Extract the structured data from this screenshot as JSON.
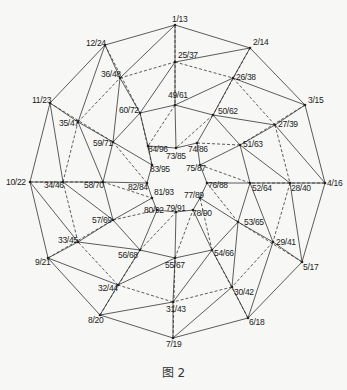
{
  "figure": {
    "caption": "图 2",
    "type": "polyhedron vertex graph (top-down projection)",
    "nodes": [
      {
        "id": "1/13",
        "x": 175,
        "y": 25,
        "lx": 172,
        "ly": 22
      },
      {
        "id": "2/14",
        "x": 250,
        "y": 48,
        "lx": 253,
        "ly": 45
      },
      {
        "id": "3/15",
        "x": 305,
        "y": 105,
        "lx": 308,
        "ly": 103
      },
      {
        "id": "4/16",
        "x": 325,
        "y": 183,
        "lx": 327,
        "ly": 186
      },
      {
        "id": "5/17",
        "x": 302,
        "y": 262,
        "lx": 303,
        "ly": 270
      },
      {
        "id": "6/18",
        "x": 248,
        "y": 318,
        "lx": 249,
        "ly": 325
      },
      {
        "id": "7/19",
        "x": 173,
        "y": 338,
        "lx": 166,
        "ly": 347
      },
      {
        "id": "8/20",
        "x": 100,
        "y": 315,
        "lx": 88,
        "ly": 323
      },
      {
        "id": "9/21",
        "x": 48,
        "y": 258,
        "lx": 35,
        "ly": 265
      },
      {
        "id": "10/22",
        "x": 30,
        "y": 182,
        "lx": 6,
        "ly": 185
      },
      {
        "id": "11/23",
        "x": 50,
        "y": 103,
        "lx": 32,
        "ly": 103
      },
      {
        "id": "12/24",
        "x": 105,
        "y": 45,
        "lx": 86,
        "ly": 46
      },
      {
        "id": "25/37",
        "x": 175,
        "y": 62,
        "lx": 178,
        "ly": 58
      },
      {
        "id": "26/38",
        "x": 233,
        "y": 78,
        "lx": 236,
        "ly": 80
      },
      {
        "id": "27/39",
        "x": 275,
        "y": 125,
        "lx": 278,
        "ly": 127
      },
      {
        "id": "28/40",
        "x": 290,
        "y": 183,
        "lx": 291,
        "ly": 191
      },
      {
        "id": "29/41",
        "x": 273,
        "y": 242,
        "lx": 276,
        "ly": 245
      },
      {
        "id": "30/42",
        "x": 232,
        "y": 287,
        "lx": 234,
        "ly": 295
      },
      {
        "id": "31/43",
        "x": 173,
        "y": 302,
        "lx": 166,
        "ly": 312
      },
      {
        "id": "32/44",
        "x": 118,
        "y": 285,
        "lx": 98,
        "ly": 291
      },
      {
        "id": "33/45",
        "x": 78,
        "y": 242,
        "lx": 58,
        "ly": 243
      },
      {
        "id": "34/46",
        "x": 63,
        "y": 182,
        "lx": 44,
        "ly": 188
      },
      {
        "id": "35/47",
        "x": 78,
        "y": 122,
        "lx": 59,
        "ly": 126
      },
      {
        "id": "36/48",
        "x": 120,
        "y": 78,
        "lx": 101,
        "ly": 77
      },
      {
        "id": "49/61",
        "x": 175,
        "y": 105,
        "lx": 168,
        "ly": 98
      },
      {
        "id": "50/62",
        "x": 213,
        "y": 115,
        "lx": 218,
        "ly": 114
      },
      {
        "id": "51/63",
        "x": 240,
        "y": 145,
        "lx": 243,
        "ly": 147
      },
      {
        "id": "52/64",
        "x": 250,
        "y": 183,
        "lx": 252,
        "ly": 191
      },
      {
        "id": "53/65",
        "x": 238,
        "y": 222,
        "lx": 244,
        "ly": 225
      },
      {
        "id": "54/66",
        "x": 212,
        "y": 250,
        "lx": 214,
        "ly": 256
      },
      {
        "id": "55/67",
        "x": 175,
        "y": 258,
        "lx": 165,
        "ly": 268
      },
      {
        "id": "56/68",
        "x": 140,
        "y": 250,
        "lx": 118,
        "ly": 258
      },
      {
        "id": "57/69",
        "x": 113,
        "y": 220,
        "lx": 92,
        "ly": 223
      },
      {
        "id": "58/70",
        "x": 103,
        "y": 182,
        "lx": 84,
        "ly": 188
      },
      {
        "id": "59/71",
        "x": 113,
        "y": 142,
        "lx": 93,
        "ly": 146
      },
      {
        "id": "60/72",
        "x": 140,
        "y": 113,
        "lx": 119,
        "ly": 113
      },
      {
        "id": "73/85",
        "x": 176,
        "y": 148,
        "lx": 166,
        "ly": 159
      },
      {
        "id": "74/86",
        "x": 197,
        "y": 143,
        "lx": 188,
        "ly": 152
      },
      {
        "id": "75/87",
        "x": 200,
        "y": 165,
        "lx": 186,
        "ly": 171
      },
      {
        "id": "76/88",
        "x": 207,
        "y": 183,
        "lx": 208,
        "ly": 188
      },
      {
        "id": "77/89",
        "x": 200,
        "y": 198,
        "lx": 184,
        "ly": 198
      },
      {
        "id": "78/90",
        "x": 193,
        "y": 210,
        "lx": 192,
        "ly": 216
      },
      {
        "id": "79/91",
        "x": 176,
        "y": 212,
        "lx": 166,
        "ly": 211
      },
      {
        "id": "80/92",
        "x": 157,
        "y": 210,
        "lx": 144,
        "ly": 213
      },
      {
        "id": "81/93",
        "x": 152,
        "y": 198,
        "lx": 154,
        "ly": 195
      },
      {
        "id": "82/84",
        "x": 147,
        "y": 183,
        "lx": 128,
        "ly": 190
      },
      {
        "id": "83/95",
        "x": 152,
        "y": 165,
        "lx": 150,
        "ly": 172
      },
      {
        "id": "84/96",
        "x": 148,
        "y": 146,
        "lx": 148,
        "ly": 152
      }
    ]
  }
}
